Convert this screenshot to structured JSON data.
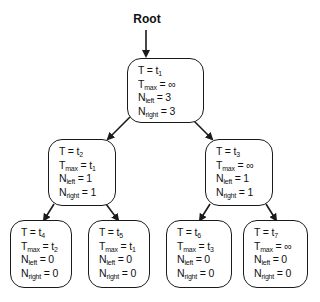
{
  "diagram": {
    "root_label": "Root",
    "edge_color": "#1a1a1a",
    "nodes": {
      "n1": {
        "t": {
          "label": "T",
          "eq": "=",
          "var": "t",
          "sub": "1"
        },
        "tmax": {
          "label": "T",
          "sub": "max",
          "eq": "=",
          "value": "∞",
          "value_sub": ""
        },
        "nleft": {
          "label": "N",
          "sub": "left",
          "eq": "=",
          "value": "3"
        },
        "nright": {
          "label": "N",
          "sub": "right",
          "eq": "=",
          "value": "3"
        }
      },
      "n2": {
        "t": {
          "label": "T",
          "eq": "=",
          "var": "t",
          "sub": "2"
        },
        "tmax": {
          "label": "T",
          "sub": "max",
          "eq": "=",
          "value": "t",
          "value_sub": "1"
        },
        "nleft": {
          "label": "N",
          "sub": "left",
          "eq": "=",
          "value": "1"
        },
        "nright": {
          "label": "N",
          "sub": "right",
          "eq": "=",
          "value": "1"
        }
      },
      "n3": {
        "t": {
          "label": "T",
          "eq": "=",
          "var": "t",
          "sub": "3"
        },
        "tmax": {
          "label": "T",
          "sub": "max",
          "eq": "=",
          "value": "∞",
          "value_sub": ""
        },
        "nleft": {
          "label": "N",
          "sub": "left",
          "eq": "=",
          "value": "1"
        },
        "nright": {
          "label": "N",
          "sub": "right",
          "eq": "=",
          "value": "1"
        }
      },
      "n4": {
        "t": {
          "label": "T",
          "eq": "=",
          "var": "t",
          "sub": "4"
        },
        "tmax": {
          "label": "T",
          "sub": "max",
          "eq": "=",
          "value": "t",
          "value_sub": "2"
        },
        "nleft": {
          "label": "N",
          "sub": "left",
          "eq": "=",
          "value": "0"
        },
        "nright": {
          "label": "N",
          "sub": "right",
          "eq": "=",
          "value": "0"
        }
      },
      "n5": {
        "t": {
          "label": "T",
          "eq": "=",
          "var": "t",
          "sub": "5"
        },
        "tmax": {
          "label": "T",
          "sub": "max",
          "eq": "=",
          "value": "t",
          "value_sub": "1"
        },
        "nleft": {
          "label": "N",
          "sub": "left",
          "eq": "=",
          "value": "0"
        },
        "nright": {
          "label": "N",
          "sub": "right",
          "eq": "=",
          "value": "0"
        }
      },
      "n6": {
        "t": {
          "label": "T",
          "eq": "=",
          "var": "t",
          "sub": "6"
        },
        "tmax": {
          "label": "T",
          "sub": "max",
          "eq": "=",
          "value": "t",
          "value_sub": "3"
        },
        "nleft": {
          "label": "N",
          "sub": "left",
          "eq": "=",
          "value": "0"
        },
        "nright": {
          "label": "N",
          "sub": "right",
          "eq": "=",
          "value": "0"
        }
      },
      "n7": {
        "t": {
          "label": "T",
          "eq": "=",
          "var": "t",
          "sub": "7"
        },
        "tmax": {
          "label": "T",
          "sub": "max",
          "eq": "=",
          "value": "∞",
          "value_sub": ""
        },
        "nleft": {
          "label": "N",
          "sub": "left",
          "eq": "=",
          "value": "0"
        },
        "nright": {
          "label": "N",
          "sub": "right",
          "eq": "=",
          "value": "0"
        }
      }
    }
  }
}
